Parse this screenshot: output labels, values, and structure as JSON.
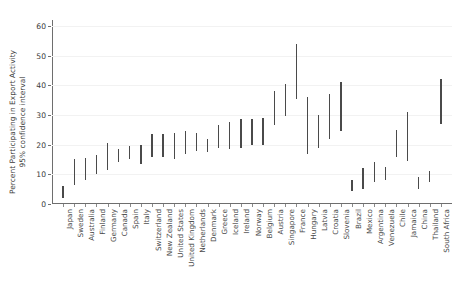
{
  "chart_data": {
    "type": "bar",
    "chart_style": "error-bar / confidence-interval range plot",
    "title": "",
    "xlabel": "",
    "ylabel_line1": "Percent Participating in Export Activity",
    "ylabel_line2": "95% confidence interval",
    "ylim": [
      0,
      62
    ],
    "ytick_labels": [
      "0",
      "10",
      "20",
      "30",
      "40",
      "50",
      "60"
    ],
    "ytick_values": [
      0,
      10,
      20,
      30,
      40,
      50,
      60
    ],
    "grid": true,
    "grid_axis": "y",
    "legend": "none",
    "bar_color": "#4a4a4a",
    "axis_color": "#6e6e6e",
    "categories": [
      "Japan",
      "Sweden",
      "Australia",
      "Finland",
      "Germany",
      "Canada",
      "Spain",
      "Italy",
      "Switzerland",
      "New Zealand",
      "United States",
      "United Kingdom",
      "Netherlands",
      "Denmark",
      "Greece",
      "Iceland",
      "Ireland",
      "Norway",
      "Belgium",
      "Austria",
      "Singapore",
      "France",
      "Hungary",
      "Latvia",
      "Croatia",
      "Slovenia",
      "Brazil",
      "Mexico",
      "Argentina",
      "Venezuela",
      "Chile",
      "Jamaica",
      "China",
      "Thailand",
      "South Africa"
    ],
    "intervals": [
      {
        "country": "Japan",
        "low": 2.0,
        "high": 6.0
      },
      {
        "country": "Sweden",
        "low": 6.5,
        "high": 15.0
      },
      {
        "country": "Australia",
        "low": 8.0,
        "high": 15.5
      },
      {
        "country": "Finland",
        "low": 10.0,
        "high": 16.5
      },
      {
        "country": "Germany",
        "low": 11.5,
        "high": 20.5
      },
      {
        "country": "Canada",
        "low": 14.0,
        "high": 18.5
      },
      {
        "country": "Spain",
        "low": 15.0,
        "high": 19.5
      },
      {
        "country": "Italy",
        "low": 13.5,
        "high": 20.0
      },
      {
        "country": "Switzerland",
        "low": 16.0,
        "high": 23.5
      },
      {
        "country": "New Zealand",
        "low": 16.0,
        "high": 23.5
      },
      {
        "country": "United States",
        "low": 15.0,
        "high": 24.0
      },
      {
        "country": "United Kingdom",
        "low": 17.0,
        "high": 24.5
      },
      {
        "country": "Netherlands",
        "low": 18.0,
        "high": 24.0
      },
      {
        "country": "Denmark",
        "low": 17.5,
        "high": 22.0
      },
      {
        "country": "Greece",
        "low": 19.0,
        "high": 26.5
      },
      {
        "country": "Iceland",
        "low": 18.5,
        "high": 27.5
      },
      {
        "country": "Ireland",
        "low": 19.0,
        "high": 28.5
      },
      {
        "country": "Norway",
        "low": 20.0,
        "high": 28.5
      },
      {
        "country": "Belgium",
        "low": 20.0,
        "high": 29.0
      },
      {
        "country": "Austria",
        "low": 26.5,
        "high": 38.0
      },
      {
        "country": "Singapore",
        "low": 29.5,
        "high": 40.5
      },
      {
        "country": "France",
        "low": 35.5,
        "high": 54.0
      },
      {
        "country": "Hungary",
        "low": 17.0,
        "high": 36.0
      },
      {
        "country": "Latvia",
        "low": 19.0,
        "high": 30.0
      },
      {
        "country": "Croatia",
        "low": 22.0,
        "high": 37.0
      },
      {
        "country": "Slovenia",
        "low": 24.5,
        "high": 41.0
      },
      {
        "country": "Brazil",
        "low": 4.5,
        "high": 8.0
      },
      {
        "country": "Mexico",
        "low": 5.0,
        "high": 12.0
      },
      {
        "country": "Argentina",
        "low": 7.5,
        "high": 14.0
      },
      {
        "country": "Venezuela",
        "low": 8.0,
        "high": 12.5
      },
      {
        "country": "Chile",
        "low": 16.0,
        "high": 25.0
      },
      {
        "country": "Jamaica",
        "low": 14.5,
        "high": 31.0
      },
      {
        "country": "China",
        "low": 5.0,
        "high": 9.0
      },
      {
        "country": "Thailand",
        "low": 7.5,
        "high": 11.0
      },
      {
        "country": "South Africa",
        "low": 27.0,
        "high": 42.0
      }
    ]
  }
}
